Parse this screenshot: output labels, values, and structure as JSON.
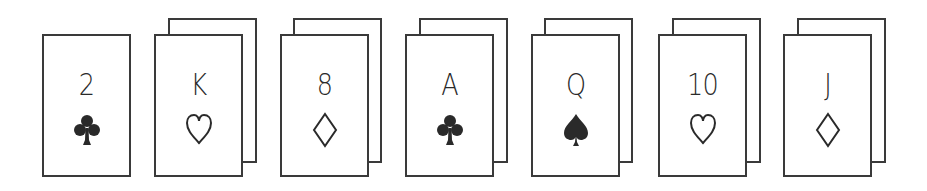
{
  "scene": {
    "description": "Row of seven playing cards; the first is a single card, the remaining six are each shown with a second card stacked behind it",
    "colors": {
      "background": "#ffffff",
      "outline": "#3a3a3a",
      "ink": "#2a2a2a"
    }
  },
  "cards": [
    {
      "rank": "2",
      "suit": "clubs",
      "suit_filled": true,
      "stacked": false
    },
    {
      "rank": "K",
      "suit": "hearts",
      "suit_filled": false,
      "stacked": true
    },
    {
      "rank": "8",
      "suit": "diamonds",
      "suit_filled": false,
      "stacked": true
    },
    {
      "rank": "A",
      "suit": "clubs",
      "suit_filled": true,
      "stacked": true
    },
    {
      "rank": "Q",
      "suit": "spades",
      "suit_filled": true,
      "stacked": true
    },
    {
      "rank": "10",
      "suit": "hearts",
      "suit_filled": false,
      "stacked": true
    },
    {
      "rank": "J",
      "suit": "diamonds",
      "suit_filled": false,
      "stacked": true
    }
  ]
}
